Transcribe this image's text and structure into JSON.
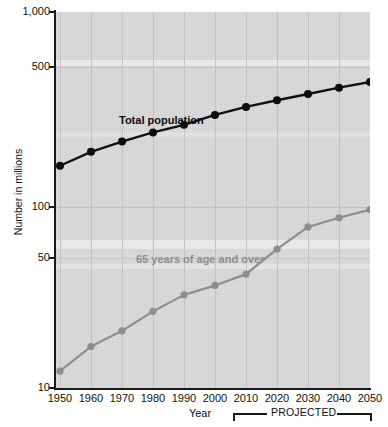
{
  "chart_data": {
    "type": "line",
    "title": "",
    "xlabel": "Year",
    "ylabel": "Number in millions",
    "yscale": "log",
    "ylim": [
      10,
      1000
    ],
    "ytick_labels": [
      "1,000",
      "500",
      "100",
      "50",
      "10"
    ],
    "ytick_values": [
      1000,
      500,
      100,
      50,
      10
    ],
    "x": [
      1950,
      1960,
      1970,
      1980,
      1990,
      2000,
      2010,
      2020,
      2030,
      2040,
      2050
    ],
    "xtick_labels": [
      "1950",
      "1960",
      "1970",
      "1980",
      "1990",
      "2000",
      "2010",
      "2020",
      "2030",
      "2040",
      "2050"
    ],
    "grid": true,
    "legend": "inline-annotation",
    "series": [
      {
        "name": "Total population",
        "color": "#0d0d0d",
        "values": [
          151,
          179,
          203,
          227,
          249,
          281,
          310,
          336,
          363,
          392,
          420
        ]
      },
      {
        "name": "65 years of age and over",
        "color": "#8d8d8d",
        "values": [
          12.3,
          16.6,
          20.1,
          25.5,
          31.2,
          35.0,
          40.2,
          54.6,
          71.5,
          80.0,
          88.5
        ]
      }
    ],
    "annotations": [
      {
        "name": "total-population-label",
        "text": "Total population"
      },
      {
        "name": "elderly-label",
        "text": "65 years of age and over"
      },
      {
        "name": "projected-bracket-label",
        "text": "PROJECTED",
        "from": 2010,
        "to": 2050
      }
    ]
  },
  "axes": {
    "y_title": "Number in millions",
    "x_title": "Year"
  }
}
